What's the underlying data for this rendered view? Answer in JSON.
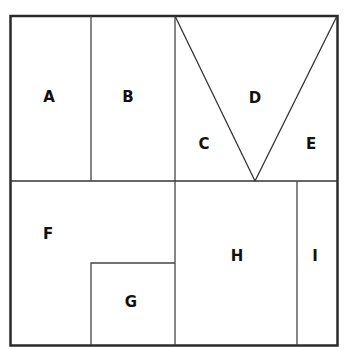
{
  "diagram": {
    "stroke_color": "#2a2a2a",
    "label_color": "#111111",
    "regions": [
      {
        "id": "A",
        "label": "A",
        "x": 49,
        "y": 97
      },
      {
        "id": "B",
        "label": "B",
        "x": 128,
        "y": 97
      },
      {
        "id": "C",
        "label": "C",
        "x": 204,
        "y": 144
      },
      {
        "id": "D",
        "label": "D",
        "x": 255,
        "y": 98
      },
      {
        "id": "E",
        "label": "E",
        "x": 311,
        "y": 144
      },
      {
        "id": "F",
        "label": "F",
        "x": 48,
        "y": 234
      },
      {
        "id": "G",
        "label": "G",
        "x": 131,
        "y": 302
      },
      {
        "id": "H",
        "label": "H",
        "x": 237,
        "y": 256
      },
      {
        "id": "I",
        "label": "I",
        "x": 315,
        "y": 256
      }
    ]
  }
}
